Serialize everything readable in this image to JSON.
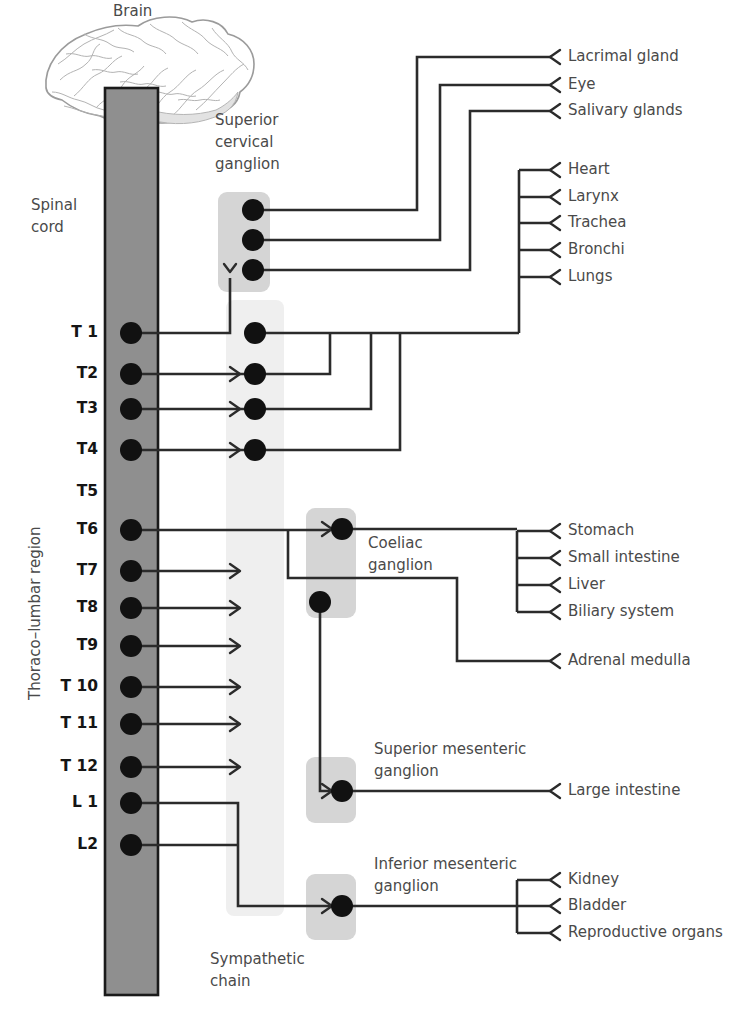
{
  "colors": {
    "line": "#2b2b2b",
    "spinal_cord_fill": "#8f8f8f",
    "spinal_cord_stroke": "#1a1a1a",
    "ganglion_box_fill": "#d5d5d5",
    "chain_fill": "#efefef",
    "node_fill": "#111111",
    "text": "#4a4a4a",
    "text_bold": "#151515"
  },
  "labels": {
    "brain": "Brain",
    "spinal_cord": "Spinal\ncord",
    "spinal_cord_line1": "Spinal",
    "spinal_cord_line2": "cord",
    "thoraco_lumbar_region": "Thoraco–lumbar region",
    "superior_cervical_ganglion": [
      "Superior",
      "cervical",
      "ganglion"
    ],
    "coeliac_ganglion": [
      "Coeliac",
      "ganglion"
    ],
    "superior_mesenteric_ganglion": [
      "Superior mesenteric",
      "ganglion"
    ],
    "inferior_mesenteric_ganglion": [
      "Inferior mesenteric",
      "ganglion"
    ],
    "sympathetic_chain": [
      "Sympathetic",
      "chain"
    ]
  },
  "spinal_segments": [
    {
      "id": "T1",
      "label": "T 1",
      "y": 333,
      "has_node": true
    },
    {
      "id": "T2",
      "label": "T2",
      "y": 374,
      "has_node": true
    },
    {
      "id": "T3",
      "label": "T3",
      "y": 409,
      "has_node": true
    },
    {
      "id": "T4",
      "label": "T4",
      "y": 450,
      "has_node": true
    },
    {
      "id": "T5",
      "label": "T5",
      "y": 492,
      "has_node": false
    },
    {
      "id": "T6",
      "label": "T6",
      "y": 530,
      "has_node": true
    },
    {
      "id": "T7",
      "label": "T7",
      "y": 571,
      "has_node": true
    },
    {
      "id": "T8",
      "label": "T8",
      "y": 608,
      "has_node": true
    },
    {
      "id": "T9",
      "label": "T9",
      "y": 646,
      "has_node": true
    },
    {
      "id": "T10",
      "label": "T 10",
      "y": 687,
      "has_node": true
    },
    {
      "id": "T11",
      "label": "T 11",
      "y": 724,
      "has_node": true
    },
    {
      "id": "T12",
      "label": "T 12",
      "y": 767,
      "has_node": true
    },
    {
      "id": "L1",
      "label": "L 1",
      "y": 803,
      "has_node": true
    },
    {
      "id": "L2",
      "label": "L2",
      "y": 845,
      "has_node": true
    }
  ],
  "target_organs": [
    {
      "id": "lacrimal-gland",
      "label": "Lacrimal gland",
      "y": 57,
      "group": "cranial"
    },
    {
      "id": "eye",
      "label": "Eye",
      "y": 85,
      "group": "cranial"
    },
    {
      "id": "salivary-glands",
      "label": "Salivary glands",
      "y": 111,
      "group": "cranial"
    },
    {
      "id": "heart",
      "label": "Heart",
      "y": 170,
      "group": "thoracic"
    },
    {
      "id": "larynx",
      "label": "Larynx",
      "y": 197,
      "group": "thoracic"
    },
    {
      "id": "trachea",
      "label": "Trachea",
      "y": 223,
      "group": "thoracic"
    },
    {
      "id": "bronchi",
      "label": "Bronchi",
      "y": 250,
      "group": "thoracic"
    },
    {
      "id": "lungs",
      "label": "Lungs",
      "y": 277,
      "group": "thoracic"
    },
    {
      "id": "stomach",
      "label": "Stomach",
      "y": 531,
      "group": "coeliac"
    },
    {
      "id": "small-intestine",
      "label": "Small intestine",
      "y": 558,
      "group": "coeliac"
    },
    {
      "id": "liver",
      "label": "Liver",
      "y": 585,
      "group": "coeliac"
    },
    {
      "id": "biliary-system",
      "label": "Biliary system",
      "y": 612,
      "group": "coeliac"
    },
    {
      "id": "adrenal-medulla",
      "label": "Adrenal medulla",
      "y": 661,
      "group": "adrenal"
    },
    {
      "id": "large-intestine",
      "label": "Large intestine",
      "y": 791,
      "group": "sup-mesenteric"
    },
    {
      "id": "kidney",
      "label": "Kidney",
      "y": 880,
      "group": "inf-mesenteric"
    },
    {
      "id": "bladder",
      "label": "Bladder",
      "y": 906,
      "group": "inf-mesenteric"
    },
    {
      "id": "reproductive-organs",
      "label": "Reproductive organs",
      "y": 933,
      "group": "inf-mesenteric"
    }
  ],
  "ganglia": [
    {
      "id": "superior-cervical",
      "x": 218,
      "y": 192,
      "w": 52,
      "h": 100,
      "nodes": [
        {
          "x": 253,
          "y": 210
        },
        {
          "x": 253,
          "y": 240
        },
        {
          "x": 253,
          "y": 270
        }
      ]
    },
    {
      "id": "coeliac",
      "x": 306,
      "y": 508,
      "w": 50,
      "h": 110,
      "nodes": [
        {
          "x": 342,
          "y": 529
        },
        {
          "x": 320,
          "y": 602
        }
      ]
    },
    {
      "id": "superior-mesenteric",
      "x": 306,
      "y": 757,
      "w": 50,
      "h": 66,
      "nodes": [
        {
          "x": 342,
          "y": 791
        }
      ]
    },
    {
      "id": "inferior-mesenteric",
      "x": 306,
      "y": 874,
      "w": 50,
      "h": 66,
      "nodes": [
        {
          "x": 342,
          "y": 906
        }
      ]
    }
  ],
  "sympathetic_chain": {
    "x": 226,
    "y": 300,
    "w": 58,
    "h": 616
  },
  "spinal_cord_bar": {
    "x": 105,
    "y": 88,
    "w": 53,
    "h": 907
  },
  "chain_nodes_x": 255
}
